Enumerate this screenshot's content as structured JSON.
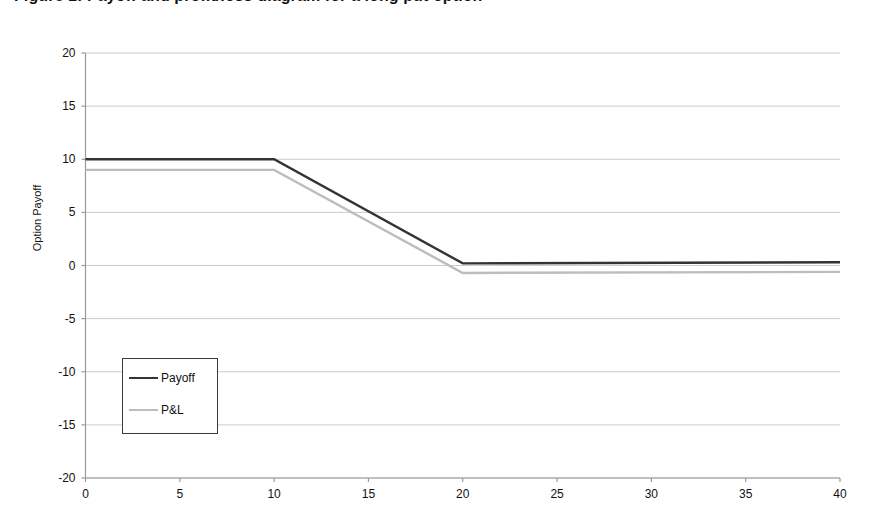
{
  "chart_data": {
    "type": "line",
    "title": "Figure 1: Payoff and profit/loss diagram for a long put option",
    "xlabel": "",
    "ylabel": "Option Payoff",
    "xlim": [
      0,
      40
    ],
    "ylim": [
      -20,
      20
    ],
    "xticks": [
      0,
      5,
      10,
      15,
      20,
      25,
      30,
      35,
      40
    ],
    "xtick_labels": [
      "0",
      "5",
      "10",
      "15",
      "20",
      "25",
      "30",
      "35",
      "40"
    ],
    "yticks": [
      20,
      15,
      10,
      5,
      0,
      -5,
      -10,
      -15,
      -20
    ],
    "ytick_labels": [
      "20",
      "15",
      "10",
      "5",
      "0",
      "-5",
      "-10",
      "-15",
      "-20"
    ],
    "grid": "horizontal",
    "legend_position": "center-left",
    "series": [
      {
        "name": "Payoff",
        "color": "#333333",
        "width": 2.4,
        "x": [
          0,
          10,
          20,
          40
        ],
        "values": [
          10.0,
          10.0,
          0.2,
          0.3
        ]
      },
      {
        "name": "P&L",
        "color": "#bdbdbd",
        "width": 2.4,
        "x": [
          0,
          10,
          20,
          40
        ],
        "values": [
          9.0,
          9.0,
          -0.7,
          -0.6
        ]
      }
    ],
    "gridline_color": "#cccccc",
    "axis_color": "#9a9a9a"
  },
  "legend": {
    "entries": [
      {
        "label": "Payoff"
      },
      {
        "label": "P&L"
      }
    ]
  }
}
